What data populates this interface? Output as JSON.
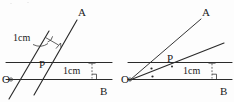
{
  "figure": {
    "background_color": "#fdfdfd",
    "ink_color": "#2a2a2a",
    "text_color": "#1a1a1a",
    "panel_count": 2
  },
  "panels": [
    {
      "id": "left-panel",
      "description": "Two parallel slanted lines crossing two parallel horizontal lines",
      "labels": {
        "ray_a": "A",
        "ray_b": "B",
        "origin": "O",
        "point_p": "P",
        "distance_slant": "1cm",
        "distance_horizontal": "1cm"
      },
      "marks": {
        "right_angle_slant": "right-angle-square",
        "right_angle_horizontal": "right-angle-square",
        "leader_line": "leader-from-1cm-label"
      }
    },
    {
      "id": "right-panel",
      "description": "Two rays from O forming equal marked angles, crossing two parallel horizontal lines",
      "labels": {
        "ray_a": "A",
        "ray_b": "B",
        "origin": "O",
        "point_p": "P",
        "distance_horizontal": "1cm"
      },
      "marks": {
        "equal_angle_upper": "dot",
        "equal_angle_lower": "dot",
        "right_angle_horizontal": "right-angle-square"
      }
    }
  ]
}
